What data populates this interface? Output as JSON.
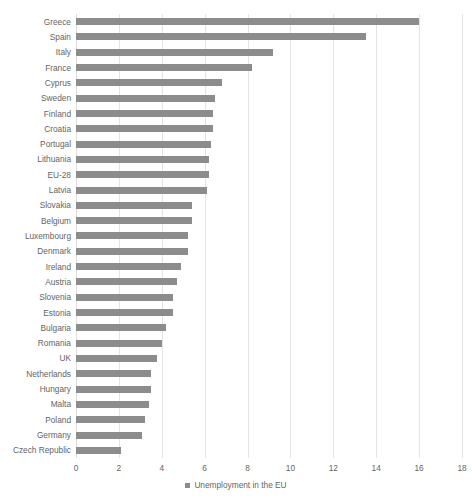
{
  "chart_data": {
    "type": "bar",
    "orientation": "horizontal",
    "title": "",
    "subtitle": "",
    "xlabel": "",
    "ylabel": "",
    "xlim": [
      0,
      18
    ],
    "xticks": [
      0,
      2,
      4,
      6,
      8,
      10,
      12,
      14,
      16,
      18
    ],
    "grid": true,
    "grid_axis": "x",
    "legend": {
      "position": "bottom-center",
      "entries": [
        {
          "name": "Unemployment in the EU",
          "color": "#8c8c8c"
        }
      ]
    },
    "series": [
      {
        "name": "Unemployment in the EU",
        "color": "#8c8c8c",
        "values": [
          16.0,
          13.5,
          9.2,
          8.2,
          6.8,
          6.5,
          6.4,
          6.4,
          6.3,
          6.2,
          6.2,
          6.1,
          5.4,
          5.4,
          5.2,
          5.2,
          4.9,
          4.7,
          4.5,
          4.5,
          4.2,
          4.0,
          3.8,
          3.5,
          3.5,
          3.4,
          3.2,
          3.1,
          2.1
        ]
      }
    ],
    "categories": [
      "Greece",
      "Spain",
      "Italy",
      "France",
      "Cyprus",
      "Sweden",
      "Finland",
      "Croatia",
      "Portugal",
      "Lithuania",
      "EU-28",
      "Latvia",
      "Slovakia",
      "Belgium",
      "Luxembourg",
      "Denmark",
      "Ireland",
      "Austria",
      "Slovenia",
      "Estonia",
      "Bulgaria",
      "Romania",
      "UK",
      "Netherlands",
      "Hungary",
      "Malta",
      "Poland",
      "Germany",
      "Czech Republic"
    ]
  },
  "colors": {
    "bar": "#8c8c8c",
    "gridline": "#e4e4e4",
    "text": "#646464",
    "background": "#ffffff"
  }
}
